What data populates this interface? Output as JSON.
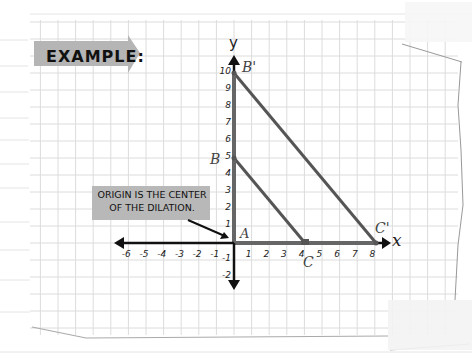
{
  "title": "EXAMPLE:",
  "callout": {
    "line1": "ORIGIN IS THE CENTER",
    "line2": "OF THE DILATION."
  },
  "axes": {
    "x_label": "x",
    "y_label": "y",
    "x_ticks": [
      "-6",
      "-5",
      "-4",
      "-3",
      "-2",
      "-1",
      "1",
      "2",
      "3",
      "4",
      "5",
      "6",
      "7",
      "8"
    ],
    "y_ticks": [
      "10",
      "9",
      "8",
      "7",
      "6",
      "5",
      "4",
      "3",
      "2",
      "1",
      "-1",
      "-2"
    ]
  },
  "points": {
    "A": {
      "label": "A",
      "x": 0,
      "y": 0
    },
    "B": {
      "label": "B",
      "x": 0,
      "y": 5
    },
    "C": {
      "label": "C",
      "x": 4,
      "y": 0
    },
    "B_prime": {
      "label": "B'",
      "x": 0,
      "y": 10
    },
    "C_prime": {
      "label": "C'",
      "x": 8,
      "y": 0
    }
  },
  "colors": {
    "grid": "#d8d8d8",
    "triangle": "#555555",
    "axis": "#111111",
    "label_box": "#b5b5b5"
  }
}
